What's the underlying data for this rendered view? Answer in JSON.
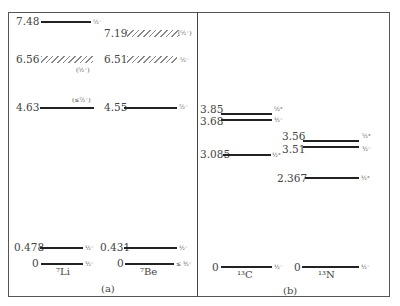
{
  "figure": {
    "panel_a": {
      "caption": "(a)",
      "li7": {
        "nucleus": "⁷Li",
        "levels": [
          {
            "energy": "7.48",
            "jp": "⁵⁄₂⁻",
            "style": "solid"
          },
          {
            "energy": "6.56",
            "jp": "(⁵⁄₂⁻)",
            "style": "hatched"
          },
          {
            "energy": "4.63",
            "jp": "(≤⁷⁄₂⁻)",
            "style": "solid"
          },
          {
            "energy": "0.478",
            "jp": "½⁻",
            "style": "solid"
          },
          {
            "energy": "0",
            "jp": "³⁄₂⁻",
            "style": "solid"
          }
        ]
      },
      "be7": {
        "nucleus": "⁷Be",
        "levels": [
          {
            "energy": "7.19",
            "jp": "(⁵⁄₂⁻)",
            "style": "hatched"
          },
          {
            "energy": "6.51",
            "jp": "⁵⁄₂⁻",
            "style": "hatched"
          },
          {
            "energy": "4.55",
            "jp": "⁷⁄₂⁻",
            "style": "solid"
          },
          {
            "energy": "0.431",
            "jp": "½⁻",
            "style": "solid"
          },
          {
            "energy": "0",
            "jp": "≤ ³⁄₂⁻",
            "style": "solid"
          }
        ]
      }
    },
    "panel_b": {
      "caption": "(b)",
      "c13": {
        "nucleus": "¹³C",
        "levels": [
          {
            "energy": "3.85",
            "jp": "⁵⁄₂⁺",
            "style": "solid"
          },
          {
            "energy": "3.68",
            "jp": "³⁄₂⁻",
            "style": "solid"
          },
          {
            "energy": "3.085",
            "jp": "½⁺",
            "style": "solid"
          },
          {
            "energy": "0",
            "jp": "½⁻",
            "style": "solid"
          }
        ]
      },
      "n13": {
        "nucleus": "¹³N",
        "levels": [
          {
            "energy": "3.56",
            "jp": "⁵⁄₂⁺",
            "style": "solid"
          },
          {
            "energy": "3.51",
            "jp": "³⁄₂⁻",
            "style": "solid"
          },
          {
            "energy": "2.367",
            "jp": "½⁺",
            "style": "solid"
          },
          {
            "energy": "0",
            "jp": "½⁻",
            "style": "solid"
          }
        ]
      }
    }
  }
}
